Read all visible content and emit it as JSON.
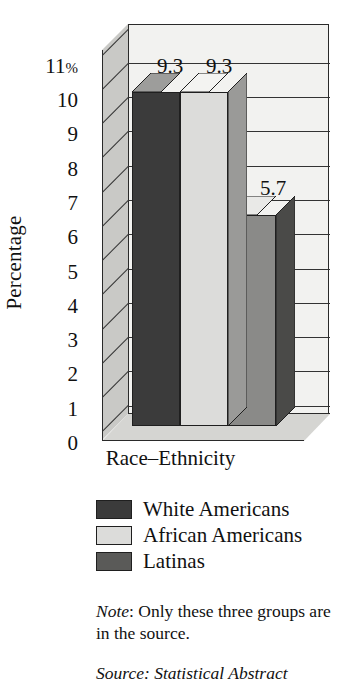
{
  "chart_data": {
    "type": "bar",
    "title": "",
    "xlabel": "Race–Ethnicity",
    "ylabel": "Percentage",
    "categories": [
      "White Americans",
      "African Americans",
      "Latinas"
    ],
    "values": [
      9.3,
      9.3,
      5.7
    ],
    "value_labels": [
      "9.3",
      "9.3",
      "5.7"
    ],
    "ylim": [
      0,
      11
    ],
    "ytick_labels": [
      "11%",
      "10",
      "9",
      "8",
      "7",
      "6",
      "5",
      "4",
      "3",
      "2",
      "1",
      "0"
    ],
    "ytick_values": [
      11,
      10,
      9,
      8,
      7,
      6,
      5,
      4,
      3,
      2,
      1,
      0
    ],
    "grid": true,
    "legend_position": "below",
    "series_colors": [
      "#3b3b3b",
      "#dcdcda",
      "#8a8a88"
    ],
    "style": "3d-column"
  },
  "axis": {
    "y_title": "Percentage",
    "x_title": "Race–Ethnicity",
    "ticks": [
      "11%",
      "10",
      "9",
      "8",
      "7",
      "6",
      "5",
      "4",
      "3",
      "2",
      "1",
      "0"
    ]
  },
  "data_labels": [
    "9.3",
    "9.3",
    "5.7"
  ],
  "legend": {
    "items": [
      {
        "label": "White Americans",
        "color": "#3b3b3b"
      },
      {
        "label": "African Americans",
        "color": "#dcdcda"
      },
      {
        "label": "Latinas",
        "color": "#8a8a88"
      }
    ]
  },
  "notes": {
    "note_prefix": "Note",
    "note_text": ":  Only these three groups are in the source.",
    "source_text": "Source: Statistical Abstract"
  },
  "colors": {
    "back_wall": "#f2f2f0",
    "side_wall": "#c9c9c6",
    "floor": "#d5d5d2",
    "outline": "#2a2a2a"
  }
}
